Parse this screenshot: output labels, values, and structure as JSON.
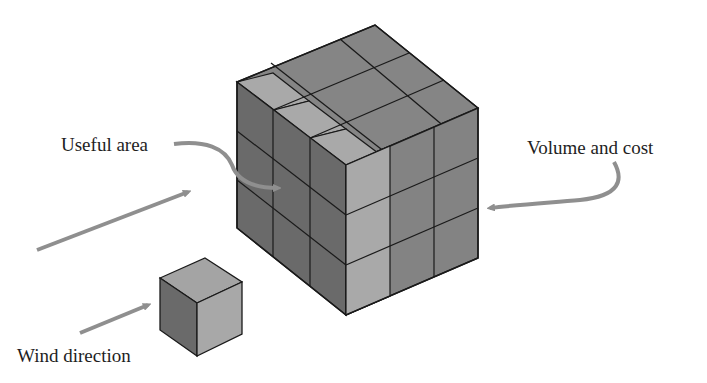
{
  "labels": {
    "useful_area": "Useful area",
    "volume_and_cost": "Volume and cost",
    "wind_direction": "Wind direction"
  },
  "colors": {
    "background": "#ffffff",
    "edge": "#1a1a1a",
    "face_dark": "#6a6a6a",
    "face_mid": "#858585",
    "face_light": "#a9a9a9",
    "arrow": "#8f8f8f",
    "text": "#1e1e1e"
  },
  "diagram": {
    "large_cube_grid": "3x3x3",
    "small_cube_grid": "1x1x1"
  }
}
